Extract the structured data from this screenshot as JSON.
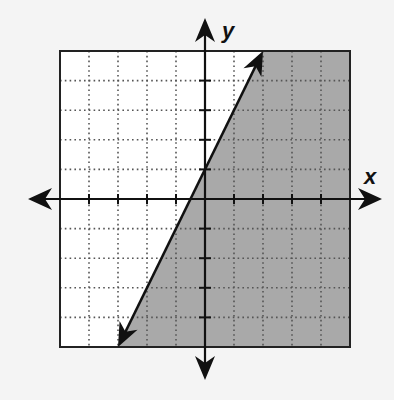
{
  "chart_data": {
    "type": "line",
    "title": "",
    "subtitle": "",
    "xlabel": "x",
    "ylabel": "y",
    "xlim": [
      -5,
      5
    ],
    "ylim": [
      -5,
      5
    ],
    "grid": true,
    "grid_style": "dotted",
    "tick_step": 1,
    "tick_labels": false,
    "legend": null,
    "series": [
      {
        "name": "boundary line y = 2x + 1",
        "style": "solid",
        "arrows": "both",
        "points": [
          [
            -3,
            -5
          ],
          [
            0,
            1
          ],
          [
            2,
            5
          ]
        ],
        "slope": 2,
        "intercept": 1
      }
    ],
    "shaded_region": {
      "description": "right of / below the line",
      "inequality": "y ≤ 2x + 1",
      "polygon": [
        [
          -3,
          -5
        ],
        [
          5,
          -5
        ],
        [
          5,
          5
        ],
        [
          2,
          5
        ]
      ],
      "color": "#a9a9a9"
    },
    "colors": {
      "background": "#f4f4f4",
      "plot_bg": "#ffffff",
      "shade": "#a9a9a9",
      "axis": "#111111",
      "grid": "#555555"
    }
  }
}
